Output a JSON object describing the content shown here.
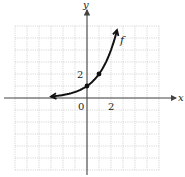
{
  "chart_data": {
    "type": "line",
    "title": "",
    "xlabel": "x",
    "ylabel": "y",
    "function_label": "f",
    "xlim": [
      -6,
      6
    ],
    "ylim": [
      -6,
      6
    ],
    "grid": true,
    "tick_labels": {
      "origin": "0",
      "x": [
        "2"
      ],
      "y": [
        "2"
      ]
    },
    "series": [
      {
        "name": "f",
        "description": "exponential growth curve f(x) = 2^x, horizontal asymptote y = 0, arrows at both ends",
        "x": [
          -3,
          -2,
          -1,
          0,
          1,
          2,
          2.5
        ],
        "y": [
          0.125,
          0.25,
          0.5,
          1,
          2,
          4,
          5.66
        ],
        "marked_points": [
          {
            "x": 0,
            "y": 1
          },
          {
            "x": 1,
            "y": 2
          }
        ]
      }
    ]
  },
  "colors": {
    "grid": "#c8c8c8",
    "axis": "#444444",
    "curve": "#111111"
  }
}
